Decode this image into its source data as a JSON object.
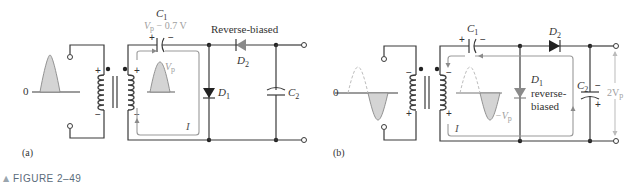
{
  "figure": {
    "label": "FIGURE 2–49",
    "marker": "▲"
  },
  "panel_a": {
    "caption": "(a)",
    "zero_label": "0",
    "c1": {
      "name": "C",
      "sub": "1",
      "voltage_label": "V",
      "voltage_sub": "p",
      "voltage_rest": " − 0.7 V",
      "plus": "+",
      "minus": "−"
    },
    "d2": {
      "name": "D",
      "sub": "2",
      "status": "Reverse-biased"
    },
    "d1": {
      "name": "D",
      "sub": "1"
    },
    "c2": {
      "name": "C",
      "sub": "2"
    },
    "secondary_wave_label": {
      "main": "V",
      "sub": "p"
    },
    "current_label": "I",
    "primary_polarity": {
      "top": "+",
      "bottom": "−"
    },
    "secondary_polarity": {
      "top": "+",
      "bottom": "−"
    }
  },
  "panel_b": {
    "caption": "(b)",
    "zero_label": "0",
    "c1": {
      "name": "C",
      "sub": "1",
      "plus": "+",
      "minus": "−"
    },
    "d2": {
      "name": "D",
      "sub": "2"
    },
    "d1": {
      "name": "D",
      "sub": "1",
      "status_line1": "reverse-",
      "status_line2": "biased"
    },
    "c2": {
      "name": "C",
      "sub": "2",
      "plus": "+",
      "minus": "−"
    },
    "secondary_wave_label": {
      "prefix": "−V",
      "sub": "p"
    },
    "output_label": {
      "main": "2V",
      "sub": "p"
    },
    "current_label": "I",
    "primary_polarity": {
      "top": "−",
      "bottom": "+"
    },
    "secondary_polarity": {
      "top": "−",
      "bottom": "+"
    }
  }
}
